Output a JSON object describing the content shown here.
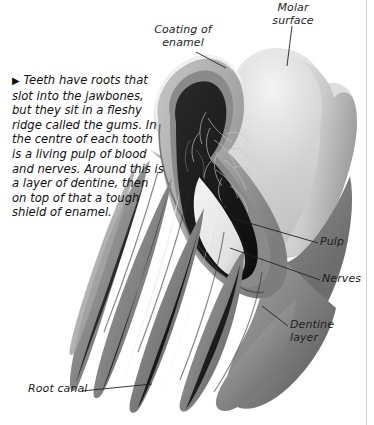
{
  "figure": {
    "caption": {
      "marker": "▶",
      "text": "Teeth have roots that slot into the jawbones, but they sit in a fleshy ridge called the gums. In the centre of each tooth is a living pulp of blood and nerves. Around this is a layer of dentine, then on top of that a tough shield of enamel."
    },
    "labels": {
      "molar_surface": "Molar\nsurface",
      "coating_of_enamel": "Coating of\nenamel",
      "pulp": "Pulp",
      "nerves": "Nerves",
      "dentine_layer": "Dentine\nlayer",
      "root_canal": "Root canal"
    },
    "colors": {
      "background": "#ffffff",
      "enamel_light": "#e2e2e2",
      "enamel_mid": "#cfcfcf",
      "dentine_mid": "#9a9a9a",
      "dentine_dark": "#6f6f6f",
      "pulp_cavity": "#1b1b1b",
      "root_canal_dark": "#101010",
      "highlight_white": "#fbfbfb",
      "leader_line": "#222222",
      "text": "#1d1d1d",
      "margin_rule": "#d4d4d4"
    }
  }
}
